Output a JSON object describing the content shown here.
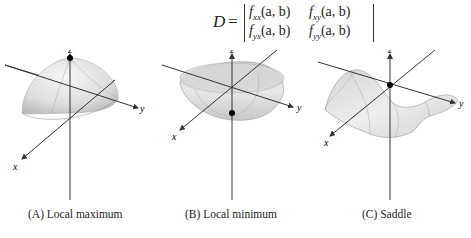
{
  "formula": {
    "lhs": "D",
    "equals": "=",
    "matrix": [
      [
        "fxx(a, b)",
        "fxy(a, b)"
      ],
      [
        "fyx(a, b)",
        "fyy(a, b)"
      ]
    ],
    "cells": {
      "r0c0": {
        "base": "f",
        "sub": "xx",
        "args": "(a, b)"
      },
      "r0c1": {
        "base": "f",
        "sub": "xy",
        "args": "(a, b)"
      },
      "r1c0": {
        "base": "f",
        "sub": "yx",
        "args": "(a, b)"
      },
      "r1c1": {
        "base": "f",
        "sub": "yy",
        "args": "(a, b)"
      }
    }
  },
  "figures": [
    {
      "id": "A",
      "caption": "(A) Local maximum",
      "axes": {
        "x": "x",
        "y": "y",
        "z": "z"
      }
    },
    {
      "id": "B",
      "caption": "(B) Local minimum",
      "axes": {
        "x": "x",
        "y": "y",
        "z": "z"
      }
    },
    {
      "id": "C",
      "caption": "(C) Saddle",
      "axes": {
        "x": "x",
        "y": "y",
        "z": "z"
      }
    }
  ],
  "colors": {
    "surface_light": "#f2f2f2",
    "surface_mid": "#d9d9d9",
    "surface_dark": "#b8b8b8",
    "axis": "#333333",
    "point": "#000000"
  }
}
